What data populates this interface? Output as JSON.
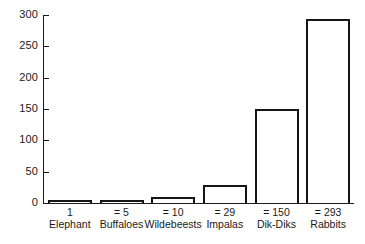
{
  "chart_data": {
    "type": "bar",
    "title": "",
    "subtitle": "",
    "xlabel": "",
    "ylabel": "",
    "categories": [
      "Elephant",
      "Buffaloes",
      "Wildebeests",
      "Impalas",
      "Dik-Diks",
      "Rabbits"
    ],
    "values": [
      1,
      5,
      10,
      29,
      150,
      293
    ],
    "value_labels": [
      "1",
      "= 5",
      "= 10",
      "= 29",
      "= 150",
      "= 293"
    ],
    "ylim": [
      0,
      300
    ],
    "yticks": [
      0,
      50,
      100,
      150,
      200,
      250,
      300
    ],
    "ytick_labels": [
      "0",
      "50",
      "100",
      "150",
      "200",
      "250",
      "300"
    ],
    "grid": false,
    "legend": false,
    "legend_position": "none",
    "bar_style": {
      "fill": "#ffffff",
      "edge": "#151515",
      "edge_width_px": 2
    },
    "axis_color": "#1a1a1a"
  },
  "axis": {
    "y_ticks": [
      {
        "label": "300",
        "value": 300
      },
      {
        "label": "250",
        "value": 250
      },
      {
        "label": "200",
        "value": 200
      },
      {
        "label": "150",
        "value": 150
      },
      {
        "label": "100",
        "value": 100
      },
      {
        "label": "50",
        "value": 50
      },
      {
        "label": "0",
        "value": 0
      }
    ]
  },
  "bars": [
    {
      "name": "Elephant",
      "value": 1,
      "value_label": "1",
      "category_label": "Elephant"
    },
    {
      "name": "Buffaloes",
      "value": 5,
      "value_label": "= 5",
      "category_label": "Buffaloes"
    },
    {
      "name": "Wildebeests",
      "value": 10,
      "value_label": "= 10",
      "category_label": "Wildebeests"
    },
    {
      "name": "Impalas",
      "value": 29,
      "value_label": "= 29",
      "category_label": "Impalas"
    },
    {
      "name": "Dik-Diks",
      "value": 150,
      "value_label": "= 150",
      "category_label": "Dik-Diks"
    },
    {
      "name": "Rabbits",
      "value": 293,
      "value_label": "= 293",
      "category_label": "Rabbits"
    }
  ]
}
